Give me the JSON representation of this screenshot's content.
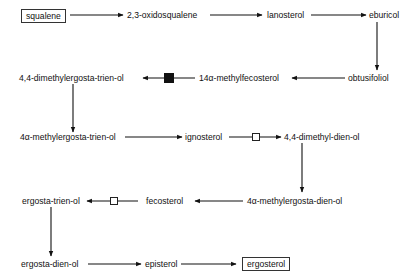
{
  "diagram": {
    "title": "",
    "nodes": {
      "squalene": "squalene",
      "oxidosqualene": "2,3-oxidosqualene",
      "lanosterol": "lanosterol",
      "eburicol": "eburicol",
      "obtusifoliol": "obtusifoliol",
      "methylfecosterol": "14α-methylfecosterol",
      "dimethylergostatrienol": "4,4-dimethylergosta-trien-ol",
      "methylergostatrienol": "4α-methylergosta-trien-ol",
      "ignosterol": "ignosterol",
      "dimethyldienol": "4,4-dimethyl-dien-ol",
      "methylergostadienol": "4α-methylergosta-dien-ol",
      "fecosterol": "fecosterol",
      "ergostatrienol": "ergosta-trien-ol",
      "ergostadienol": "ergosta-dien-ol",
      "episterol": "episterol",
      "ergosterol": "ergosterol"
    },
    "edges": [
      {
        "from": "squalene",
        "to": "oxidosqualene"
      },
      {
        "from": "oxidosqualene",
        "to": "lanosterol"
      },
      {
        "from": "lanosterol",
        "to": "eburicol"
      },
      {
        "from": "eburicol",
        "to": "obtusifoliol"
      },
      {
        "from": "obtusifoliol",
        "to": "methylfecosterol"
      },
      {
        "from": "methylfecosterol",
        "to": "dimethylergostatrienol",
        "marker": "filled-square"
      },
      {
        "from": "dimethylergostatrienol",
        "to": "methylergostatrienol"
      },
      {
        "from": "methylergostatrienol",
        "to": "ignosterol"
      },
      {
        "from": "ignosterol",
        "to": "dimethyldienol",
        "marker": "open-square"
      },
      {
        "from": "dimethyldienol",
        "to": "methylergostadienol"
      },
      {
        "from": "methylergostadienol",
        "to": "fecosterol"
      },
      {
        "from": "fecosterol",
        "to": "ergostatrienol",
        "marker": "open-square"
      },
      {
        "from": "ergostatrienol",
        "to": "ergostadienol"
      },
      {
        "from": "ergostadienol",
        "to": "episterol"
      },
      {
        "from": "episterol",
        "to": "ergosterol"
      }
    ],
    "boxed_nodes": [
      "squalene",
      "ergosterol"
    ],
    "colors": {
      "line": "#111111",
      "background": "#ffffff"
    }
  }
}
